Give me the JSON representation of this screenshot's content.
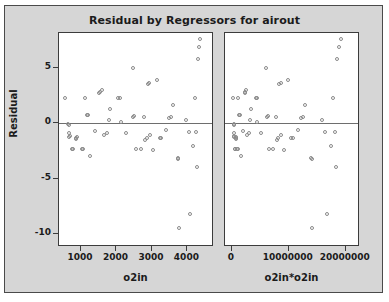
{
  "chart_data": {
    "type": "scatter",
    "title": "Residual by Regressors for airout",
    "ylabel": "Residual",
    "ylim": [
      -11.2,
      8.2
    ],
    "yticks": [
      5,
      0,
      -5,
      -10
    ],
    "yticklabels": [
      "5",
      "0",
      "-5",
      "-10"
    ],
    "grid": false,
    "legend": null,
    "reference_line": 0,
    "panels": [
      {
        "name": "left-panel",
        "xlabel": "o2in",
        "xlim": [
          380,
          4750
        ],
        "xticks": [
          1000,
          2000,
          3000,
          4000
        ],
        "xticklabels": [
          "1000",
          "2000",
          "3000",
          "4000"
        ],
        "points": [
          {
            "x": 560,
            "y": 2.3
          },
          {
            "x": 660,
            "y": -0.1
          },
          {
            "x": 665,
            "y": -0.15
          },
          {
            "x": 672,
            "y": -0.9
          },
          {
            "x": 690,
            "y": -1.25
          },
          {
            "x": 700,
            "y": -1.2
          },
          {
            "x": 760,
            "y": -2.35
          },
          {
            "x": 800,
            "y": -2.35
          },
          {
            "x": 860,
            "y": -1.35
          },
          {
            "x": 880,
            "y": -1.45
          },
          {
            "x": 900,
            "y": -1.3
          },
          {
            "x": 1030,
            "y": -2.4
          },
          {
            "x": 1080,
            "y": -2.4
          },
          {
            "x": 1120,
            "y": 2.3
          },
          {
            "x": 1180,
            "y": 0.75
          },
          {
            "x": 1200,
            "y": 0.7
          },
          {
            "x": 1270,
            "y": -3.0
          },
          {
            "x": 1420,
            "y": -0.75
          },
          {
            "x": 1530,
            "y": 2.75
          },
          {
            "x": 1560,
            "y": 2.85
          },
          {
            "x": 1600,
            "y": 3.0
          },
          {
            "x": 1650,
            "y": -1.05
          },
          {
            "x": 1760,
            "y": -0.9
          },
          {
            "x": 1790,
            "y": 0.3
          },
          {
            "x": 1840,
            "y": 1.3
          },
          {
            "x": 2060,
            "y": 2.25
          },
          {
            "x": 2120,
            "y": 2.3
          },
          {
            "x": 2140,
            "y": 0.05
          },
          {
            "x": 2270,
            "y": -0.9
          },
          {
            "x": 2480,
            "y": 4.95
          },
          {
            "x": 2490,
            "y": 0.55
          },
          {
            "x": 2520,
            "y": 0.6
          },
          {
            "x": 2560,
            "y": -2.4
          },
          {
            "x": 2700,
            "y": -2.35
          },
          {
            "x": 2790,
            "y": 0.55
          },
          {
            "x": 2830,
            "y": -1.5
          },
          {
            "x": 2870,
            "y": -1.35
          },
          {
            "x": 2900,
            "y": 3.5
          },
          {
            "x": 2940,
            "y": 3.6
          },
          {
            "x": 2960,
            "y": -1.1
          },
          {
            "x": 3050,
            "y": -2.45
          },
          {
            "x": 3160,
            "y": 3.9
          },
          {
            "x": 3230,
            "y": -1.4
          },
          {
            "x": 3280,
            "y": -1.4
          },
          {
            "x": 3420,
            "y": -0.6
          },
          {
            "x": 3500,
            "y": 0.45
          },
          {
            "x": 3540,
            "y": 0.55
          },
          {
            "x": 3600,
            "y": 1.6
          },
          {
            "x": 3740,
            "y": -3.2
          },
          {
            "x": 3760,
            "y": -3.25
          },
          {
            "x": 3770,
            "y": -9.55
          },
          {
            "x": 3980,
            "y": 0.3
          },
          {
            "x": 4060,
            "y": -0.8
          },
          {
            "x": 4100,
            "y": -8.25
          },
          {
            "x": 4180,
            "y": -2.05
          },
          {
            "x": 4230,
            "y": 2.3
          },
          {
            "x": 4260,
            "y": -0.85
          },
          {
            "x": 4280,
            "y": -3.95
          },
          {
            "x": 4300,
            "y": 5.8
          },
          {
            "x": 4340,
            "y": 6.9
          },
          {
            "x": 4380,
            "y": 7.6
          }
        ]
      },
      {
        "name": "right-panel",
        "xlabel": "o2in*o2in",
        "xlim": [
          -1200000,
          22500000
        ],
        "xticks": [
          0,
          10000000,
          20000000
        ],
        "xticklabels": [
          "0",
          "10000000",
          "20000000"
        ],
        "points": [
          {
            "x": 314000,
            "y": 2.3
          },
          {
            "x": 436000,
            "y": -0.1
          },
          {
            "x": 442000,
            "y": -0.15
          },
          {
            "x": 452000,
            "y": -0.9
          },
          {
            "x": 476000,
            "y": -1.25
          },
          {
            "x": 490000,
            "y": -1.2
          },
          {
            "x": 578000,
            "y": -2.35
          },
          {
            "x": 640000,
            "y": -2.35
          },
          {
            "x": 740000,
            "y": -1.35
          },
          {
            "x": 774000,
            "y": -1.45
          },
          {
            "x": 810000,
            "y": -1.3
          },
          {
            "x": 1061000,
            "y": -2.4
          },
          {
            "x": 1166000,
            "y": -2.4
          },
          {
            "x": 1254000,
            "y": 2.3
          },
          {
            "x": 1392000,
            "y": 0.75
          },
          {
            "x": 1440000,
            "y": 0.7
          },
          {
            "x": 1613000,
            "y": -3.0
          },
          {
            "x": 2016000,
            "y": -0.75
          },
          {
            "x": 2341000,
            "y": 2.75
          },
          {
            "x": 2434000,
            "y": 2.85
          },
          {
            "x": 2560000,
            "y": 3.0
          },
          {
            "x": 2722000,
            "y": -1.05
          },
          {
            "x": 3098000,
            "y": -0.9
          },
          {
            "x": 3204000,
            "y": 0.3
          },
          {
            "x": 3386000,
            "y": 1.3
          },
          {
            "x": 4244000,
            "y": 2.25
          },
          {
            "x": 4494000,
            "y": 2.3
          },
          {
            "x": 4580000,
            "y": 0.05
          },
          {
            "x": 5153000,
            "y": -0.9
          },
          {
            "x": 6150000,
            "y": 4.95
          },
          {
            "x": 6200000,
            "y": 0.55
          },
          {
            "x": 6350000,
            "y": 0.6
          },
          {
            "x": 6554000,
            "y": -2.4
          },
          {
            "x": 7290000,
            "y": -2.35
          },
          {
            "x": 7784000,
            "y": 0.55
          },
          {
            "x": 8009000,
            "y": -1.5
          },
          {
            "x": 8237000,
            "y": -1.35
          },
          {
            "x": 8410000,
            "y": 3.5
          },
          {
            "x": 8644000,
            "y": 3.6
          },
          {
            "x": 8762000,
            "y": -1.1
          },
          {
            "x": 9303000,
            "y": -2.45
          },
          {
            "x": 9986000,
            "y": 3.9
          },
          {
            "x": 10433000,
            "y": -1.4
          },
          {
            "x": 10758000,
            "y": -1.4
          },
          {
            "x": 11696000,
            "y": -0.6
          },
          {
            "x": 12250000,
            "y": 0.45
          },
          {
            "x": 12532000,
            "y": 0.55
          },
          {
            "x": 12960000,
            "y": 1.6
          },
          {
            "x": 13988000,
            "y": -3.2
          },
          {
            "x": 14138000,
            "y": -3.25
          },
          {
            "x": 14213000,
            "y": -9.55
          },
          {
            "x": 15840000,
            "y": 0.3
          },
          {
            "x": 16484000,
            "y": -0.8
          },
          {
            "x": 16810000,
            "y": -8.25
          },
          {
            "x": 17472000,
            "y": -2.05
          },
          {
            "x": 17893000,
            "y": 2.3
          },
          {
            "x": 18148000,
            "y": -0.85
          },
          {
            "x": 18318000,
            "y": -3.95
          },
          {
            "x": 18490000,
            "y": 5.8
          },
          {
            "x": 18835000,
            "y": 6.9
          },
          {
            "x": 19184000,
            "y": 7.6
          }
        ]
      }
    ]
  }
}
